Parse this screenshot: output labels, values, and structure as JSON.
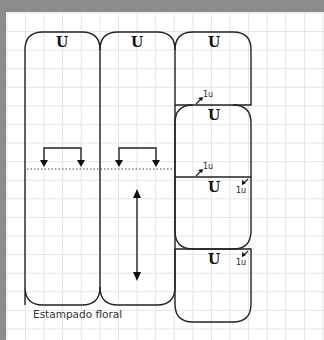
{
  "diagram": {
    "caption": "Estampado floral",
    "pieces": [
      {
        "id": "piece-1",
        "label": "U"
      },
      {
        "id": "piece-2",
        "label": "U"
      },
      {
        "id": "piece-3",
        "label": "U"
      },
      {
        "id": "piece-4",
        "label": "U"
      },
      {
        "id": "piece-4b",
        "label": "U"
      },
      {
        "id": "piece-5",
        "label": "U"
      }
    ],
    "offset_labels": [
      "1u",
      "1u",
      "1u",
      "1u"
    ],
    "colors": {
      "stroke": "#222222",
      "background": "#ffffff",
      "grid": "#e4e4e4",
      "frame": "#8c8c8c"
    }
  }
}
